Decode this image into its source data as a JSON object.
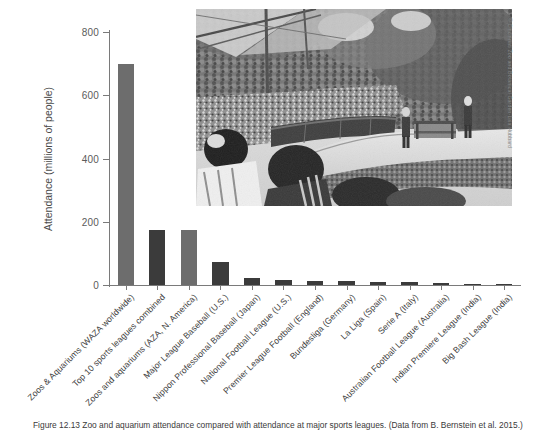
{
  "chart_data": {
    "type": "bar",
    "title": "",
    "xlabel": "",
    "ylabel": "Attendance (millions of people)",
    "ylim": [
      0,
      800
    ],
    "yticks": [
      0,
      200,
      400,
      600,
      800
    ],
    "grid": false,
    "legend": "none",
    "categories": [
      "Zoos & Aquariums (WAZA worldwide)",
      "Top 10 sports leagues combined",
      "Zoos and aquariums (AZA, N. America)",
      "Major League Baseball (U.S.)",
      "Nippon Professional Baseball (Japan)",
      "National Football League (U.S.)",
      "Premier League Football (England)",
      "Bundesliga (Germany)",
      "La Liga (Spain)",
      "Serie A (Italy)",
      "Australian Football League (Australia)",
      "Indian Premiere League (India)",
      "Big Bash League (India)"
    ],
    "values": [
      700,
      175,
      175,
      73,
      22,
      17,
      14,
      13,
      10,
      9,
      7,
      2,
      1
    ],
    "bar_colors": [
      "#6d6d6d",
      "#3b3b3b",
      "#6d6d6d",
      "#3b3b3b",
      "#3b3b3b",
      "#3b3b3b",
      "#3b3b3b",
      "#3b3b3b",
      "#3b3b3b",
      "#3b3b3b",
      "#3b3b3b",
      "#3b3b3b",
      "#3b3b3b"
    ]
  },
  "photo": {
    "alt_name": "zoo-amphitheater-bird-show-photo",
    "credit": "© Cincinnati Zoo and Botanical Garden-Lisa Hubbard"
  },
  "caption": {
    "text": "Figure 12.13  Zoo and aquarium attendance compared with attendance at major sports leagues. (Data from B. Bernstein et al. 2015.)"
  },
  "colors": {
    "bar_light": "#6d6d6d",
    "bar_dark": "#3b3b3b",
    "axis": "#7a7a7a",
    "text": "#3d3d3d"
  }
}
